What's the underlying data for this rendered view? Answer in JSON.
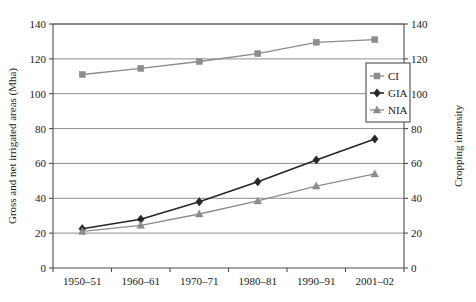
{
  "chart_data": {
    "type": "line",
    "title": "",
    "categories": [
      "1950–51",
      "1960–61",
      "1970–71",
      "1980–81",
      "1990–91",
      "2001–02"
    ],
    "series": [
      {
        "name": "CI",
        "marker": "square",
        "color": "#8c8c8c",
        "axis": "right",
        "values": [
          111,
          114.5,
          118.5,
          123,
          129.5,
          131
        ]
      },
      {
        "name": "GIA",
        "marker": "diamond",
        "color": "#262626",
        "axis": "left",
        "values": [
          22.5,
          28,
          38,
          49.5,
          62,
          74
        ]
      },
      {
        "name": "NIA",
        "marker": "triangle",
        "color": "#8c8c8c",
        "axis": "left",
        "values": [
          21,
          24.5,
          31,
          38.5,
          47,
          54
        ]
      }
    ],
    "xlabel": "",
    "ylabel": "Gross and net irrigated areas (Mha)",
    "y2label": "Cropping intensity",
    "ylim": [
      0,
      140
    ],
    "y2lim": [
      0,
      140
    ],
    "yticks": [
      0,
      20,
      40,
      60,
      80,
      100,
      120,
      140
    ],
    "y2ticks": [
      0,
      20,
      40,
      60,
      80,
      100,
      120,
      140
    ],
    "ytick_labels": [
      "0",
      "20",
      "40",
      "60",
      "80",
      "100",
      "120",
      "140"
    ],
    "y2tick_labels": [
      "0",
      "20",
      "40",
      "60",
      "80",
      "100",
      "120",
      "140"
    ],
    "grid": "horizontal",
    "legend_position": "upper-right-inside",
    "legend_entries": [
      "CI",
      "GIA",
      "NIA"
    ],
    "colors": {
      "grid": "#808080",
      "frame": "#4d4d4d",
      "ci": "#8c8c8c",
      "gia": "#262626",
      "nia": "#8c8c8c",
      "background": "#ffffff"
    }
  }
}
